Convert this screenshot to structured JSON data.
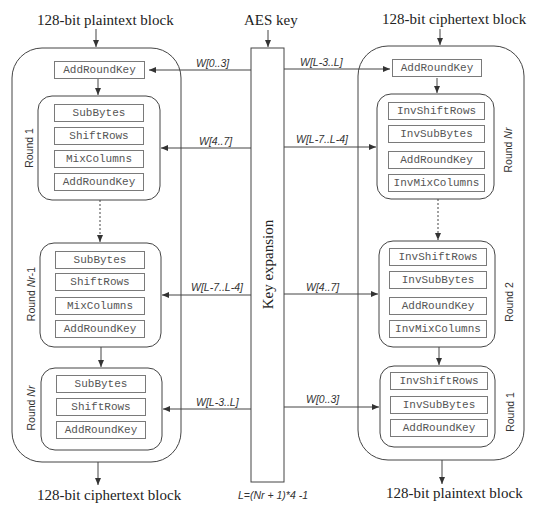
{
  "encrypt": {
    "input_label": "128-bit plaintext block",
    "output_label": "128-bit ciphertext block",
    "initial_step": "AddRoundKey",
    "rounds": [
      {
        "label": "Round 1",
        "steps": [
          "SubBytes",
          "ShiftRows",
          "MixColumns",
          "AddRoundKey"
        ]
      },
      {
        "label_prefix": "Round ",
        "label_italic": "Nr",
        "label_suffix": "-1",
        "steps": [
          "SubBytes",
          "ShiftRows",
          "MixColumns",
          "AddRoundKey"
        ]
      },
      {
        "label_prefix": "Round ",
        "label_italic": "Nr",
        "label_suffix": "",
        "steps": [
          "SubBytes",
          "ShiftRows",
          "AddRoundKey"
        ]
      }
    ]
  },
  "decrypt": {
    "input_label": "128-bit ciphertext block",
    "output_label": "128-bit plaintext block",
    "initial_step": "AddRoundKey",
    "rounds": [
      {
        "label_prefix": "Round ",
        "label_italic": "Nr",
        "label_suffix": "",
        "steps": [
          "InvShiftRows",
          "InvSubBytes",
          "AddRoundKey",
          "InvMixColumns"
        ]
      },
      {
        "label": "Round 2",
        "steps": [
          "InvShiftRows",
          "InvSubBytes",
          "AddRoundKey",
          "InvMixColumns"
        ]
      },
      {
        "label": "Round 1",
        "steps": [
          "InvShiftRows",
          "InvSubBytes",
          "AddRoundKey"
        ]
      }
    ]
  },
  "key": {
    "input_label": "AES key",
    "box_label": "Key expansion",
    "footnote": "L=(Nr + 1)*4 -1",
    "left_words": [
      "W[0..3]",
      "W[4..7]",
      "W[L-7..L-4]",
      "W[L-3..L]"
    ],
    "right_words": [
      "W[L-3..L]",
      "W[L-7..L-4]",
      "W[4..7]",
      "W[0..3]"
    ]
  },
  "colors": {
    "line": "#444444",
    "step_border": "#7a7a7a",
    "step_text": "#555555"
  }
}
